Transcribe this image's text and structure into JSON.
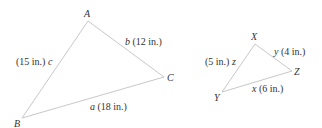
{
  "diagram": {
    "line_color": "#c8c8c8",
    "text_color": "#333333",
    "triangles": [
      {
        "name": "ABC",
        "vertices": {
          "A": {
            "label": "A",
            "x": 88,
            "y": 21
          },
          "B": {
            "label": "B",
            "x": 22,
            "y": 118
          },
          "C": {
            "label": "C",
            "x": 164,
            "y": 77
          }
        },
        "sides": {
          "a": {
            "letter": "a",
            "measure": "(18 in.)"
          },
          "b": {
            "letter": "b",
            "measure": "(12 in.)"
          },
          "c": {
            "letter": "c",
            "measure": "(15 in.)"
          }
        }
      },
      {
        "name": "XYZ",
        "vertices": {
          "X": {
            "label": "X",
            "x": 255,
            "y": 44
          },
          "Y": {
            "label": "Y",
            "x": 222,
            "y": 92
          },
          "Z": {
            "label": "Z",
            "x": 292,
            "y": 71
          }
        },
        "sides": {
          "x": {
            "letter": "x",
            "measure": "(6 in.)"
          },
          "y": {
            "letter": "y",
            "measure": "(4 in.)"
          },
          "z": {
            "letter": "z",
            "measure": "(5 in.)"
          }
        }
      }
    ]
  }
}
